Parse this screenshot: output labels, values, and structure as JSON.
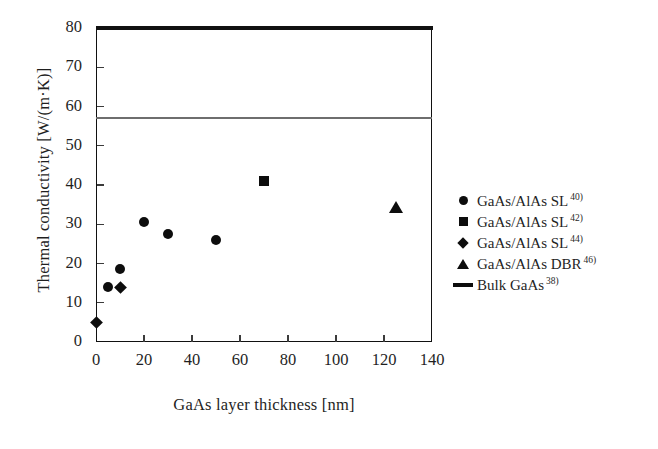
{
  "chart_data": {
    "type": "scatter",
    "title": "",
    "xlabel": "GaAs layer thickness [nm]",
    "ylabel": "Thermal conductivity [W/(m·K)]",
    "xlim": [
      0,
      140
    ],
    "ylim": [
      0,
      80
    ],
    "xticks": [
      0,
      20,
      40,
      60,
      80,
      100,
      120,
      140
    ],
    "yticks": [
      0,
      10,
      20,
      30,
      40,
      50,
      60,
      70,
      80
    ],
    "xtick_labels": [
      "0",
      "20",
      "40",
      "60",
      "80",
      "100",
      "120",
      "140"
    ],
    "ytick_labels": [
      "0",
      "10",
      "20",
      "30",
      "40",
      "50",
      "60",
      "70",
      "80"
    ],
    "grid": false,
    "legend_position": "right-outside",
    "series": [
      {
        "name": "GaAs/AlAs SL",
        "ref": "40)",
        "marker": "circle",
        "color": "#0d0d0d",
        "points": [
          {
            "x": 5,
            "y": 14.0
          },
          {
            "x": 10,
            "y": 18.5
          },
          {
            "x": 20,
            "y": 30.5
          },
          {
            "x": 30,
            "y": 27.5
          },
          {
            "x": 50,
            "y": 26.0
          }
        ]
      },
      {
        "name": "GaAs/AlAs SL",
        "ref": "42)",
        "marker": "square",
        "color": "#0d0d0d",
        "points": [
          {
            "x": 70,
            "y": 41.0
          }
        ]
      },
      {
        "name": "GaAs/AlAs SL",
        "ref": "44)",
        "marker": "diamond",
        "color": "#0d0d0d",
        "points": [
          {
            "x": 0,
            "y": 5.0
          },
          {
            "x": 10,
            "y": 14.0
          }
        ]
      },
      {
        "name": "GaAs/AlAs DBR",
        "ref": "46)",
        "marker": "triangle",
        "color": "#0d0d0d",
        "points": [
          {
            "x": 125,
            "y": 34.5
          }
        ]
      },
      {
        "name": "Bulk GaAs",
        "ref": "38)",
        "marker": "line",
        "color": "#6e6e6e",
        "reference_value": 57.0
      }
    ]
  },
  "legend": {
    "items": [
      {
        "label": "GaAs/AlAs SL",
        "ref": "40)",
        "marker": "circle-marker"
      },
      {
        "label": "GaAs/AlAs SL",
        "ref": "42)",
        "marker": "square-marker"
      },
      {
        "label": "GaAs/AlAs SL",
        "ref": "44)",
        "marker": "diamond-marker"
      },
      {
        "label": "GaAs/AlAs DBR",
        "ref": "46)",
        "marker": "triangle-marker"
      },
      {
        "label": "Bulk GaAs",
        "ref": "38)",
        "marker": "line-marker"
      }
    ]
  }
}
